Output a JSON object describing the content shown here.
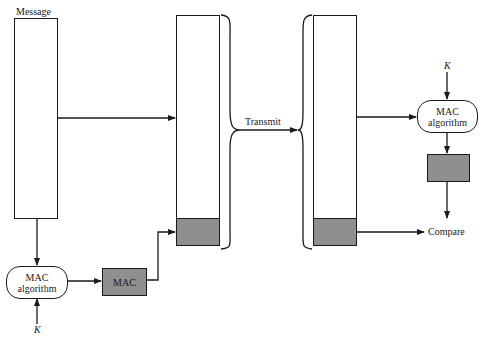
{
  "diagram": {
    "title_label": "Message",
    "transmit_label": "Transmit",
    "compare_label": "Compare",
    "sender": {
      "mac_algorithm": {
        "line1": "MAC",
        "line2": "algorithm"
      },
      "key_label": "K",
      "mac_label": "MAC"
    },
    "receiver": {
      "mac_algorithm": {
        "line1": "MAC",
        "line2": "algorithm"
      },
      "key_label": "K"
    },
    "colors": {
      "line": "#1a1a1a",
      "mac_fill": "#8f8f8f",
      "background": "#ffffff"
    }
  }
}
